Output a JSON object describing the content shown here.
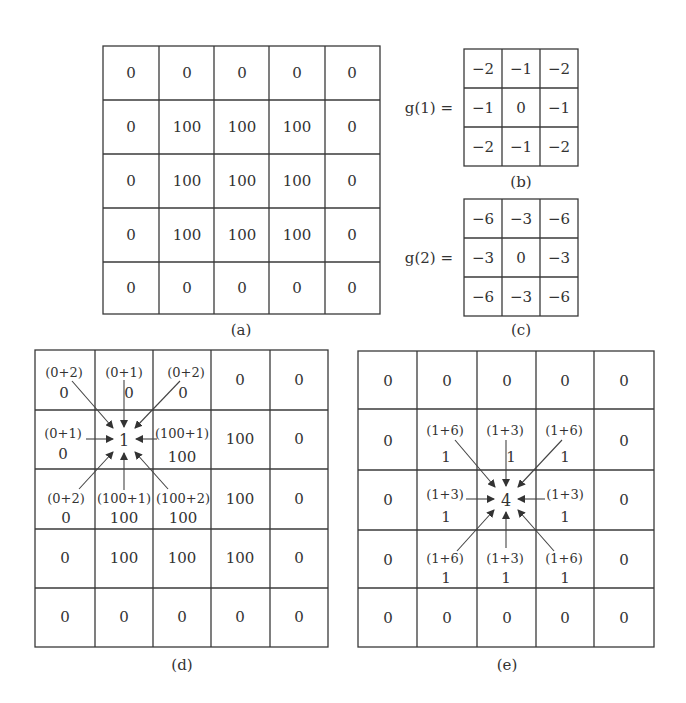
{
  "figure": {
    "panel_a": {
      "label": "(a)",
      "rows": [
        [
          "0",
          "0",
          "0",
          "0",
          "0"
        ],
        [
          "0",
          "100",
          "100",
          "100",
          "0"
        ],
        [
          "0",
          "100",
          "100",
          "100",
          "0"
        ],
        [
          "0",
          "100",
          "100",
          "100",
          "0"
        ],
        [
          "0",
          "0",
          "0",
          "0",
          "0"
        ]
      ]
    },
    "panel_b": {
      "label": "(b)",
      "equation": "g(1) =",
      "rows": [
        [
          "−2",
          "−1",
          "−2"
        ],
        [
          "−1",
          "0",
          "−1"
        ],
        [
          "−2",
          "−1",
          "−2"
        ]
      ]
    },
    "panel_c": {
      "label": "(c)",
      "equation": "g(2) =",
      "rows": [
        [
          "−6",
          "−3",
          "−6"
        ],
        [
          "−3",
          "0",
          "−3"
        ],
        [
          "−6",
          "−3",
          "−6"
        ]
      ]
    },
    "panel_d": {
      "label": "(d)",
      "center_value": "1",
      "neighbors": {
        "tl": {
          "expr": "(0+2)",
          "value": "0"
        },
        "t": {
          "expr": "(0+1)",
          "value": "0"
        },
        "tr": {
          "expr": "(0+2)",
          "value": "0"
        },
        "l": {
          "expr": "(0+1)",
          "value": "0"
        },
        "r": {
          "expr": "(100+1)",
          "value": "100"
        },
        "bl": {
          "expr": "(0+2)",
          "value": "0"
        },
        "b": {
          "expr": "(100+1)",
          "value": "100"
        },
        "br": {
          "expr": "(100+2)",
          "value": "100"
        }
      },
      "rows": [
        [
          "",
          "",
          "",
          "0",
          "0"
        ],
        [
          "",
          "",
          "",
          "100",
          "0"
        ],
        [
          "",
          "",
          "",
          "100",
          "0"
        ],
        [
          "0",
          "100",
          "100",
          "100",
          "0"
        ],
        [
          "0",
          "0",
          "0",
          "0",
          "0"
        ]
      ]
    },
    "panel_e": {
      "label": "(e)",
      "center_value": "4",
      "neighbors": {
        "tl": {
          "expr": "(1+6)",
          "value": "1"
        },
        "t": {
          "expr": "(1+3)",
          "value": "1"
        },
        "tr": {
          "expr": "(1+6)",
          "value": "1"
        },
        "l": {
          "expr": "(1+3)",
          "value": "1"
        },
        "r": {
          "expr": "(1+3)",
          "value": "1"
        },
        "bl": {
          "expr": "(1+6)",
          "value": "1"
        },
        "b": {
          "expr": "(1+3)",
          "value": "1"
        },
        "br": {
          "expr": "(1+6)",
          "value": "1"
        }
      },
      "rows": [
        [
          "0",
          "0",
          "0",
          "0",
          "0"
        ],
        [
          "0",
          "",
          "",
          "",
          "0"
        ],
        [
          "0",
          "",
          "",
          "",
          "0"
        ],
        [
          "0",
          "",
          "",
          "",
          "0"
        ],
        [
          "0",
          "0",
          "0",
          "0",
          "0"
        ]
      ]
    }
  }
}
